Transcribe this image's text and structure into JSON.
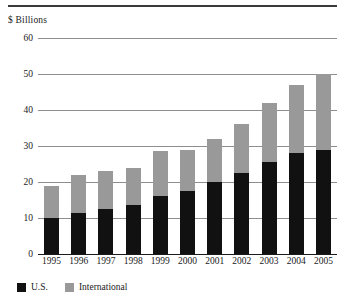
{
  "figure": {
    "y_unit_label": "$ Billions",
    "rule": "horizontal-rule"
  },
  "legend": {
    "position": "bottom-left",
    "items": [
      {
        "label": "U.S.",
        "color": "#111111",
        "swatch": "square-swatch"
      },
      {
        "label": "International",
        "color": "#999999",
        "swatch": "square-swatch"
      }
    ]
  },
  "axis": {
    "y_ticks": [
      "0",
      "10",
      "20",
      "30",
      "40",
      "50",
      "60"
    ],
    "x_ticks": [
      "1995",
      "1996",
      "1997",
      "1998",
      "1999",
      "2000",
      "2001",
      "2002",
      "2003",
      "2004",
      "2005"
    ]
  },
  "chart_data": {
    "type": "bar",
    "stacked": true,
    "title": "",
    "subtitle": "",
    "xlabel": "",
    "ylabel": "$ Billions",
    "ylim": [
      0,
      60
    ],
    "ytick_step": 10,
    "grid": true,
    "legend_position": "bottom-left",
    "categories": [
      "1995",
      "1996",
      "1997",
      "1998",
      "1999",
      "2000",
      "2001",
      "2002",
      "2003",
      "2004",
      "2005"
    ],
    "series": [
      {
        "name": "U.S.",
        "color": "#111111",
        "values": [
          10,
          11.5,
          12.5,
          13.5,
          16,
          17.5,
          20,
          22.5,
          25.5,
          28,
          29
        ]
      },
      {
        "name": "International",
        "color": "#999999",
        "values": [
          9,
          10.5,
          10.5,
          10.5,
          12.5,
          11.5,
          12,
          13.5,
          16.5,
          19,
          21
        ]
      }
    ],
    "totals": [
      19,
      22,
      23,
      24,
      28.5,
      29,
      32,
      36,
      42,
      47,
      50
    ]
  }
}
